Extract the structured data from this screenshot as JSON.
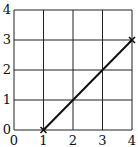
{
  "chart_data": {
    "type": "line",
    "title": "",
    "xlabel": "",
    "ylabel": "",
    "xlim": [
      0,
      4
    ],
    "ylim": [
      0,
      4
    ],
    "grid": true,
    "legend": null,
    "x_ticks": [
      "0",
      "1",
      "2",
      "3",
      "4"
    ],
    "y_ticks": [
      "0",
      "1",
      "2",
      "3",
      "4"
    ],
    "series": [
      {
        "name": "line",
        "marker": "x",
        "color": "#111111",
        "points": [
          [
            1,
            0
          ],
          [
            4,
            3
          ]
        ]
      }
    ]
  },
  "colors": {
    "grid": "#222222",
    "line": "#111111",
    "background": "#ffffff"
  }
}
